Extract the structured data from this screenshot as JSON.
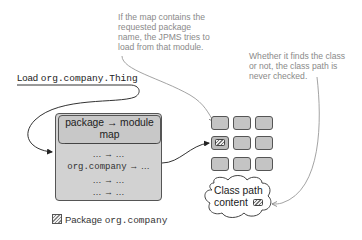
{
  "captions": {
    "jpms_lookup": [
      "If the map contains the",
      "requested package",
      "name, the JPMS tries to",
      "load from that module."
    ],
    "class_path": [
      "Whether it finds the class",
      "or not, the class path is",
      "never checked."
    ]
  },
  "load_request": {
    "prefix": "Load",
    "class_name": "org.company.Thing"
  },
  "map_box": {
    "header_line1": "package → module",
    "header_line2": "map",
    "rows": [
      {
        "key": "…",
        "arrow": "→",
        "value": "…",
        "mono": false
      },
      {
        "key": "org.company",
        "arrow": "→",
        "value": "…",
        "mono": true
      },
      {
        "key": "…",
        "arrow": "→",
        "value": "…",
        "mono": false
      },
      {
        "key": "…",
        "arrow": "→",
        "value": "…",
        "mono": false
      }
    ]
  },
  "module_grid": {
    "rows": 3,
    "cols": 3,
    "highlighted": {
      "row": 1,
      "col": 0,
      "icon": "package-icon"
    }
  },
  "class_path_cloud": {
    "line1": "Class path",
    "line2": "content",
    "icon": "package-icon"
  },
  "legend": {
    "icon": "package-icon",
    "label": "Package",
    "package_name": "org.company"
  },
  "colors": {
    "box_fill": "#d2d2d2",
    "border": "#555555",
    "caption_text": "#8a8a8a",
    "line": "#444444"
  }
}
